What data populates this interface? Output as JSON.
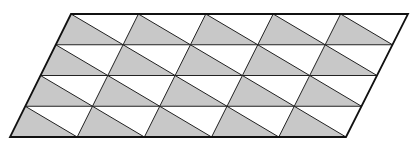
{
  "diagram": {
    "shape": "parallelogram",
    "corners": {
      "top_left": [
        71,
        14
      ],
      "top_right": [
        408,
        14
      ],
      "bottom_right": [
        346,
        137
      ],
      "bottom_left": [
        10,
        137
      ]
    },
    "columns": 5,
    "rows": 4,
    "diagonal": "cell top-left to cell bottom-right",
    "shaded_triangle": "lower-left",
    "colors": {
      "background": "#ffffff",
      "shaded_fill": "#c8c8c8",
      "unshaded_fill": "#ffffff",
      "line": "#222222",
      "outline": "#111111"
    }
  }
}
